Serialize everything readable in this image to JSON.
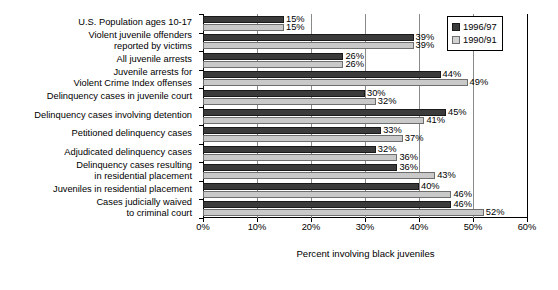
{
  "chart_data": {
    "type": "bar",
    "orientation": "horizontal",
    "title": "",
    "xlabel": "Percent involving black juveniles",
    "ylabel": "",
    "xlim": [
      0,
      60
    ],
    "xticks": [
      0,
      10,
      20,
      30,
      40,
      50,
      60
    ],
    "xtick_labels": [
      "0%",
      "10%",
      "20%",
      "30%",
      "40%",
      "50%",
      "60%"
    ],
    "grid": true,
    "legend_position": "top-right",
    "categories": [
      "U.S. Population ages 10-17",
      "Violent juvenile offenders\nreported by victims",
      "All juvenile arrests",
      "Juvenile arrests for\nViolent Crime Index offenses",
      "Delinquency cases in juvenile court",
      "Delinquency cases involving detention",
      "Petitioned delinquency cases",
      "Adjudicated delinquency cases",
      "Delinquency cases resulting\nin residential placement",
      "Juveniles in residential placement",
      "Cases judicially waived\nto criminal court"
    ],
    "series": [
      {
        "name": "1996/97",
        "color": "#3b3b3b",
        "values": [
          15,
          39,
          26,
          44,
          30,
          45,
          33,
          32,
          36,
          40,
          46
        ],
        "labels": [
          "15%",
          "39%",
          "26%",
          "44%",
          "30%",
          "45%",
          "33%",
          "32%",
          "36%",
          "40%",
          "46%"
        ]
      },
      {
        "name": "1990/91",
        "color": "#c9c9c9",
        "values": [
          15,
          39,
          26,
          49,
          32,
          41,
          37,
          36,
          43,
          46,
          52
        ],
        "labels": [
          "15%",
          "39%",
          "26%",
          "49%",
          "32%",
          "41%",
          "37%",
          "36%",
          "43%",
          "46%",
          "52%"
        ]
      }
    ]
  },
  "legend": {
    "items": [
      {
        "label": "1996/97",
        "swatch": "dark-swatch-icon"
      },
      {
        "label": "1990/91",
        "swatch": "light-swatch-icon"
      }
    ]
  }
}
